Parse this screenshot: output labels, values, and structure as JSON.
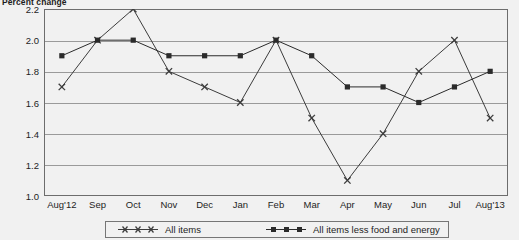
{
  "chart_data": {
    "type": "line",
    "title": "Percent change",
    "xlabel": "",
    "ylabel": "Percent change",
    "ylim": [
      1.0,
      2.2
    ],
    "ytick_step": 0.2,
    "grid": true,
    "legend_position": "bottom",
    "categories": [
      "Aug'12",
      "Sep",
      "Oct",
      "Nov",
      "Dec",
      "Jan",
      "Feb",
      "Mar",
      "Apr",
      "May",
      "Jun",
      "Jul",
      "Aug'13"
    ],
    "yticks": [
      "1.0",
      "1.2",
      "1.4",
      "1.6",
      "1.8",
      "2.0",
      "2.2"
    ],
    "series": [
      {
        "name": "All items",
        "marker": "cross",
        "color": "#3c3c3c",
        "values": [
          1.7,
          2.0,
          2.2,
          1.8,
          1.7,
          1.6,
          2.0,
          1.5,
          1.1,
          1.4,
          1.8,
          2.0,
          1.5
        ]
      },
      {
        "name": "All items less food and energy",
        "marker": "square",
        "color": "#2b2b2b",
        "values": [
          1.9,
          2.0,
          2.0,
          1.9,
          1.9,
          1.9,
          2.0,
          1.9,
          1.7,
          1.7,
          1.6,
          1.7,
          1.8
        ]
      }
    ]
  },
  "legend": {
    "items": [
      {
        "label": "All items"
      },
      {
        "label": "All items less food and energy"
      }
    ]
  },
  "colors": {
    "background": "#f1f1f1",
    "gridline": "#9a9a9a",
    "frame": "#6d6d6d",
    "text": "#1d1d1d"
  }
}
